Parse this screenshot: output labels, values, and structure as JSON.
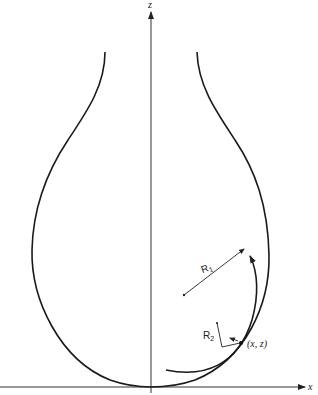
{
  "diagram": {
    "axes": {
      "z_label": "z",
      "x_label": "x"
    },
    "labels": {
      "r1_main": "R",
      "r1_sub": "1",
      "r2_main": "R",
      "r2_sub": "2",
      "point": "(x, z)"
    },
    "colors": {
      "stroke": "#1a1a1a",
      "background": "#ffffff"
    }
  }
}
